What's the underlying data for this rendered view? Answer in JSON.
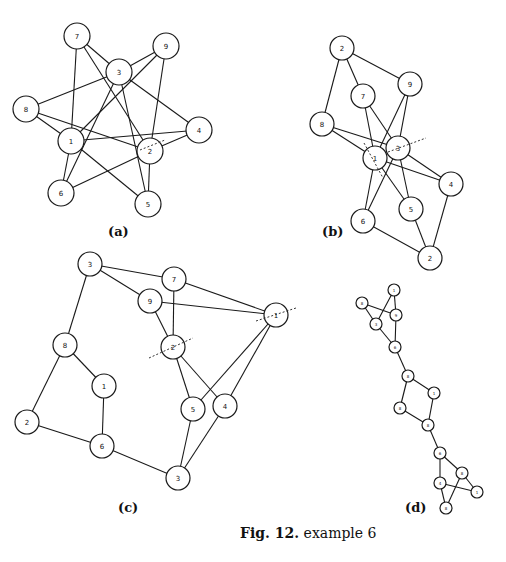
{
  "figure": {
    "caption_prefix": "Fig. 12.",
    "caption_text": " example 6"
  },
  "panels": [
    {
      "id": "a",
      "label": "(a)",
      "label_pos": [
        108,
        234
      ],
      "node_radius": 13,
      "nodes": [
        {
          "id": "a7",
          "label": "7",
          "x": 77,
          "y": 36
        },
        {
          "id": "a9",
          "label": "9",
          "x": 166,
          "y": 46
        },
        {
          "id": "a3",
          "label": "3",
          "x": 119,
          "y": 72
        },
        {
          "id": "a8",
          "label": "8",
          "x": 26,
          "y": 109
        },
        {
          "id": "a4",
          "label": "4",
          "x": 199,
          "y": 130
        },
        {
          "id": "a1",
          "label": "1",
          "x": 71,
          "y": 141
        },
        {
          "id": "a2",
          "label": "2",
          "x": 150,
          "y": 151
        },
        {
          "id": "a6",
          "label": "6",
          "x": 61,
          "y": 193
        },
        {
          "id": "a5",
          "label": "5",
          "x": 148,
          "y": 204
        }
      ],
      "edges": [
        [
          "a7",
          "a1"
        ],
        [
          "a7",
          "a3"
        ],
        [
          "a7",
          "a2"
        ],
        [
          "a9",
          "a3"
        ],
        [
          "a9",
          "a1"
        ],
        [
          "a9",
          "a2"
        ],
        [
          "a3",
          "a8"
        ],
        [
          "a3",
          "a6"
        ],
        [
          "a3",
          "a5"
        ],
        [
          "a3",
          "a4"
        ],
        [
          "a8",
          "a1"
        ],
        [
          "a8",
          "a2"
        ],
        [
          "a1",
          "a4"
        ],
        [
          "a1",
          "a6"
        ],
        [
          "a1",
          "a5"
        ],
        [
          "a2",
          "a4"
        ],
        [
          "a2",
          "a6"
        ],
        [
          "a2",
          "a5"
        ]
      ],
      "cuts": [
        [
          [
            140,
            150
          ],
          [
            165,
            140
          ]
        ]
      ]
    },
    {
      "id": "b",
      "label": "(b)",
      "label_pos": [
        322,
        234
      ],
      "node_radius": 12,
      "nodes": [
        {
          "id": "b2t",
          "label": "2",
          "x": 342,
          "y": 48
        },
        {
          "id": "b9",
          "label": "9",
          "x": 410,
          "y": 84
        },
        {
          "id": "b7",
          "label": "7",
          "x": 363,
          "y": 96
        },
        {
          "id": "b8",
          "label": "8",
          "x": 322,
          "y": 124
        },
        {
          "id": "b3",
          "label": "3",
          "x": 398,
          "y": 148
        },
        {
          "id": "b1",
          "label": "1",
          "x": 375,
          "y": 158
        },
        {
          "id": "b4",
          "label": "4",
          "x": 451,
          "y": 184
        },
        {
          "id": "b5",
          "label": "5",
          "x": 411,
          "y": 209
        },
        {
          "id": "b6",
          "label": "6",
          "x": 363,
          "y": 221
        },
        {
          "id": "b2b",
          "label": "2",
          "x": 430,
          "y": 258
        }
      ],
      "edges": [
        [
          "b2t",
          "b7"
        ],
        [
          "b2t",
          "b9"
        ],
        [
          "b2t",
          "b8"
        ],
        [
          "b7",
          "b1"
        ],
        [
          "b7",
          "b3"
        ],
        [
          "b9",
          "b1"
        ],
        [
          "b9",
          "b3"
        ],
        [
          "b8",
          "b1"
        ],
        [
          "b8",
          "b3"
        ],
        [
          "b1",
          "b4"
        ],
        [
          "b3",
          "b4"
        ],
        [
          "b1",
          "b5"
        ],
        [
          "b3",
          "b5"
        ],
        [
          "b1",
          "b6"
        ],
        [
          "b3",
          "b6"
        ],
        [
          "b4",
          "b2b"
        ],
        [
          "b5",
          "b2b"
        ],
        [
          "b6",
          "b2b"
        ]
      ],
      "cuts": [
        [
          [
            364,
            143
          ],
          [
            383,
            178
          ]
        ],
        [
          [
            388,
            152
          ],
          [
            426,
            138
          ]
        ]
      ]
    },
    {
      "id": "c",
      "label": "(c)",
      "label_pos": [
        118,
        510
      ],
      "node_radius": 12,
      "nodes": [
        {
          "id": "c3t",
          "label": "3",
          "x": 90,
          "y": 264
        },
        {
          "id": "c7",
          "label": "7",
          "x": 174,
          "y": 279
        },
        {
          "id": "c9",
          "label": "9",
          "x": 150,
          "y": 301
        },
        {
          "id": "c1r",
          "label": "1",
          "x": 276,
          "y": 315
        },
        {
          "id": "c8",
          "label": "8",
          "x": 65,
          "y": 345
        },
        {
          "id": "c2",
          "label": "2",
          "x": 173,
          "y": 347
        },
        {
          "id": "c1",
          "label": "1",
          "x": 104,
          "y": 386
        },
        {
          "id": "c5",
          "label": "5",
          "x": 193,
          "y": 409
        },
        {
          "id": "c4",
          "label": "4",
          "x": 225,
          "y": 406
        },
        {
          "id": "c2l",
          "label": "2",
          "x": 27,
          "y": 422
        },
        {
          "id": "c6",
          "label": "6",
          "x": 102,
          "y": 446
        },
        {
          "id": "c3b",
          "label": "3",
          "x": 178,
          "y": 478
        }
      ],
      "edges": [
        [
          "c3t",
          "c7"
        ],
        [
          "c3t",
          "c9"
        ],
        [
          "c3t",
          "c8"
        ],
        [
          "c7",
          "c2"
        ],
        [
          "c7",
          "c1r"
        ],
        [
          "c9",
          "c1r"
        ],
        [
          "c9",
          "c2"
        ],
        [
          "c2",
          "c5"
        ],
        [
          "c2",
          "c4"
        ],
        [
          "c1r",
          "c5"
        ],
        [
          "c1r",
          "c4"
        ],
        [
          "c8",
          "c1"
        ],
        [
          "c8",
          "c2l"
        ],
        [
          "c1",
          "c6"
        ],
        [
          "c2l",
          "c6"
        ],
        [
          "c6",
          "c3b"
        ],
        [
          "c5",
          "c3b"
        ],
        [
          "c4",
          "c3b"
        ]
      ],
      "cuts": [
        [
          [
            149,
            358
          ],
          [
            193,
            338
          ]
        ],
        [
          [
            256,
            321
          ],
          [
            296,
            308
          ]
        ]
      ]
    },
    {
      "id": "d",
      "label": "(d)",
      "label_pos": [
        405,
        510
      ],
      "node_radius": 6,
      "nodes": [
        {
          "id": "d_a",
          "label": "1",
          "x": 394,
          "y": 290
        },
        {
          "id": "d_b",
          "label": "8",
          "x": 362,
          "y": 303
        },
        {
          "id": "d_c",
          "label": "9",
          "x": 396,
          "y": 315
        },
        {
          "id": "d_d",
          "label": "3",
          "x": 376,
          "y": 324
        },
        {
          "id": "d_e",
          "label": "6",
          "x": 395,
          "y": 347
        },
        {
          "id": "d_f",
          "label": "8",
          "x": 408,
          "y": 376
        },
        {
          "id": "d_g",
          "label": "1",
          "x": 434,
          "y": 393
        },
        {
          "id": "d_h",
          "label": "8",
          "x": 400,
          "y": 408
        },
        {
          "id": "d_i",
          "label": "8",
          "x": 428,
          "y": 425
        },
        {
          "id": "d_j",
          "label": "6",
          "x": 440,
          "y": 453
        },
        {
          "id": "d_k",
          "label": "8",
          "x": 462,
          "y": 473
        },
        {
          "id": "d_l",
          "label": "4",
          "x": 440,
          "y": 483
        },
        {
          "id": "d_m",
          "label": "1",
          "x": 477,
          "y": 492
        },
        {
          "id": "d_n",
          "label": "8",
          "x": 446,
          "y": 508
        }
      ],
      "edges": [
        [
          "d_a",
          "d_c"
        ],
        [
          "d_a",
          "d_d"
        ],
        [
          "d_b",
          "d_c"
        ],
        [
          "d_b",
          "d_d"
        ],
        [
          "d_c",
          "d_e"
        ],
        [
          "d_d",
          "d_e"
        ],
        [
          "d_e",
          "d_f"
        ],
        [
          "d_f",
          "d_g"
        ],
        [
          "d_f",
          "d_h"
        ],
        [
          "d_g",
          "d_i"
        ],
        [
          "d_h",
          "d_i"
        ],
        [
          "d_i",
          "d_j"
        ],
        [
          "d_j",
          "d_k"
        ],
        [
          "d_j",
          "d_l"
        ],
        [
          "d_k",
          "d_m"
        ],
        [
          "d_k",
          "d_n"
        ],
        [
          "d_l",
          "d_m"
        ],
        [
          "d_l",
          "d_n"
        ]
      ],
      "cuts": []
    }
  ]
}
